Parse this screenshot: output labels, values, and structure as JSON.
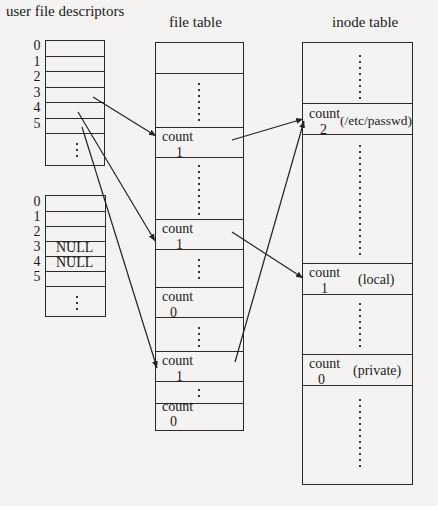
{
  "titles": {
    "user_fd": "user file descriptors",
    "file_table": "file table",
    "inode_table": "inode table"
  },
  "user_fd_table_1": {
    "indices": [
      "0",
      "1",
      "2",
      "3",
      "4",
      "5"
    ],
    "entries": [
      "",
      "",
      "",
      "",
      "",
      ""
    ],
    "continuation": "⋮"
  },
  "user_fd_table_2": {
    "indices": [
      "0",
      "1",
      "2",
      "3",
      "4",
      "5"
    ],
    "entries": [
      "",
      "",
      "",
      "NULL",
      "NULL",
      ""
    ],
    "continuation": "⋮"
  },
  "file_table": {
    "entries": [
      {
        "label": "count",
        "value": "1"
      },
      {
        "label": "count",
        "value": "1"
      },
      {
        "label": "count",
        "value": "0"
      },
      {
        "label": "count",
        "value": "1"
      },
      {
        "label": "count",
        "value": "0"
      }
    ]
  },
  "inode_table": {
    "entries": [
      {
        "label": "count",
        "value": "2",
        "name": "(/etc/passwd)"
      },
      {
        "label": "count",
        "value": "1",
        "name": "(local)"
      },
      {
        "label": "count",
        "value": "0",
        "name": "(private)"
      }
    ]
  },
  "arrows": [
    {
      "from": "user_fd_1[3]",
      "to": "file_table[0]"
    },
    {
      "from": "user_fd_1[4]",
      "to": "file_table[1]"
    },
    {
      "from": "user_fd_1[5]",
      "to": "file_table[3]"
    },
    {
      "from": "file_table[0]",
      "to": "inode_table[0]"
    },
    {
      "from": "file_table[1]",
      "to": "inode_table[1]"
    },
    {
      "from": "file_table[3]",
      "to": "inode_table[0]"
    }
  ]
}
